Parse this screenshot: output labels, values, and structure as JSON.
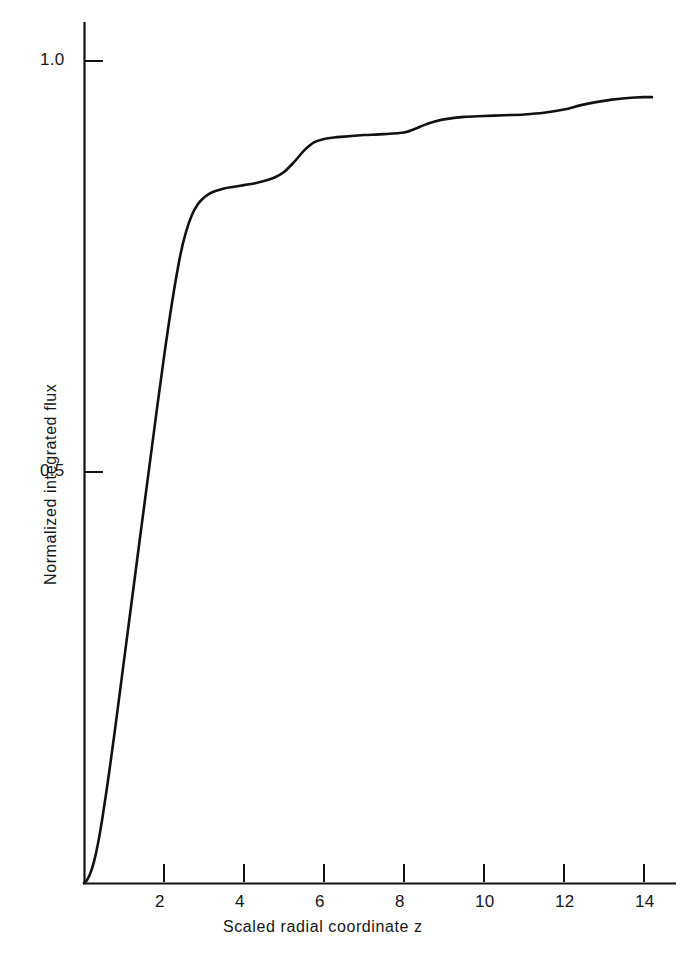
{
  "chart_data": {
    "type": "line",
    "title": "",
    "xlabel": "Scaled radial coordinate z",
    "ylabel": "Normalized integrated flux",
    "xlim": [
      0,
      14.8
    ],
    "ylim": [
      0,
      1.07
    ],
    "xticks": [
      2,
      4,
      6,
      8,
      10,
      12,
      14
    ],
    "xticklabels": [
      "2",
      "4",
      "6",
      "8",
      "10",
      "12",
      "14"
    ],
    "yticks": [
      0.5,
      1.0
    ],
    "yticklabels": [
      "0.5",
      "1.0"
    ],
    "grid": false,
    "legend": null,
    "line_color": "#111111",
    "series": [
      {
        "name": "Normalized integrated flux",
        "x": [
          0.0,
          0.08,
          0.16,
          0.25,
          0.35,
          0.45,
          0.55,
          0.65,
          0.8,
          0.95,
          1.1,
          1.25,
          1.4,
          1.6,
          1.8,
          2.0,
          2.2,
          2.4,
          2.55,
          2.7,
          2.85,
          3.0,
          3.15,
          3.3,
          3.5,
          3.75,
          4.0,
          4.25,
          4.5,
          4.75,
          5.0,
          5.25,
          5.5,
          5.75,
          6.0,
          6.25,
          6.5,
          6.75,
          7.0,
          7.5,
          8.0,
          8.25,
          8.5,
          8.75,
          9.0,
          9.5,
          10.0,
          10.5,
          11.0,
          11.5,
          12.0,
          12.4,
          12.8,
          13.2,
          13.6,
          14.0,
          14.2
        ],
        "y": [
          0.0,
          0.004,
          0.012,
          0.026,
          0.048,
          0.076,
          0.108,
          0.142,
          0.196,
          0.252,
          0.308,
          0.364,
          0.42,
          0.494,
          0.568,
          0.64,
          0.706,
          0.762,
          0.792,
          0.813,
          0.826,
          0.834,
          0.839,
          0.842,
          0.845,
          0.847,
          0.849,
          0.851,
          0.854,
          0.858,
          0.865,
          0.877,
          0.891,
          0.901,
          0.905,
          0.907,
          0.908,
          0.909,
          0.91,
          0.911,
          0.913,
          0.917,
          0.922,
          0.926,
          0.929,
          0.932,
          0.933,
          0.934,
          0.935,
          0.937,
          0.941,
          0.946,
          0.95,
          0.953,
          0.955,
          0.956,
          0.956
        ]
      }
    ]
  },
  "axes": {
    "y_tick_1_label": "1.0",
    "y_tick_0_5_label": "0.5",
    "x_tick_labels": [
      "2",
      "4",
      "6",
      "8",
      "10",
      "12",
      "14"
    ],
    "x_axis_title": "Scaled radial coordinate z",
    "y_axis_title": "Normalized integrated flux"
  }
}
